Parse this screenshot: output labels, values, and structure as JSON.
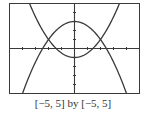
{
  "chart_data": {
    "type": "line",
    "title": "",
    "xlabel": "",
    "ylabel": "",
    "xlim": [
      -5,
      5
    ],
    "ylim": [
      -5,
      5
    ],
    "x_tick_step": 1,
    "y_tick_step": 1,
    "grid": false,
    "legend": null,
    "series": [
      {
        "name": "upward parabola",
        "shape": "y = x^2/2 - 1",
        "vertex": [
          0,
          -1
        ],
        "x": [
          -3.46,
          -3,
          -2,
          -1,
          0,
          1,
          2,
          3,
          3.46
        ],
        "y": [
          5,
          3.5,
          1,
          -0.5,
          -1,
          -0.5,
          1,
          3.5,
          5
        ]
      },
      {
        "name": "downward parabola",
        "shape": "y = 3 - x^2/2",
        "vertex": [
          0,
          3
        ],
        "x": [
          -4,
          -3,
          -2,
          -1,
          0,
          1,
          2,
          3,
          4
        ],
        "y": [
          -5,
          -1.5,
          1,
          2.5,
          3,
          2.5,
          1,
          -1.5,
          -5
        ]
      }
    ],
    "intersections": [
      [
        -2,
        1
      ],
      [
        2,
        1
      ]
    ],
    "caption": "[−5, 5] by [−5, 5]"
  },
  "caption": "[−5, 5] by [−5, 5]",
  "colors": {
    "curve": "#3a3a3a",
    "axis": "#3a3a3a",
    "frame": "#3a3a3a"
  }
}
